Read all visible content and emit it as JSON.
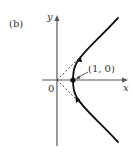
{
  "panel_label": "(b)",
  "axes": {
    "x_label": "x",
    "y_label": "y",
    "origin_label": "0"
  },
  "point": {
    "label": "(1, 0)",
    "x": 1,
    "y": 0
  },
  "curve": {
    "description": "right branch of hyperbola x^2 - y^2 = 1 traced upward",
    "asymptotes": [
      "y = x",
      "y = -x"
    ],
    "direction": "upward"
  },
  "colors": {
    "curve": "#111111",
    "axes": "#555555",
    "asymptote": "#333333"
  }
}
